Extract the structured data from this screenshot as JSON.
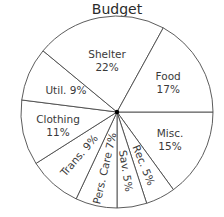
{
  "chart_data": {
    "type": "pie",
    "title": "Budget",
    "start": "3 o'clock, clockwise",
    "slices": [
      {
        "label": "Misc.",
        "value": 15,
        "text": "15%"
      },
      {
        "label": "Rec.",
        "value": 5,
        "text": "5%"
      },
      {
        "label": "Sav.",
        "value": 5,
        "text": "5%"
      },
      {
        "label": "Pers. Care",
        "value": 7,
        "text": "7%"
      },
      {
        "label": "Trans.",
        "value": 9,
        "text": "9%"
      },
      {
        "label": "Clothing",
        "value": 11,
        "text": "11%"
      },
      {
        "label": "Util.",
        "value": 9,
        "text": "9%"
      },
      {
        "label": "Shelter",
        "value": 22,
        "text": "22%"
      },
      {
        "label": "Food",
        "value": 17,
        "text": "17%"
      }
    ],
    "legend": "none",
    "colors": {
      "fill": "#ffffff",
      "stroke": "#4a4a4a",
      "text": "#3a3a3a"
    }
  }
}
